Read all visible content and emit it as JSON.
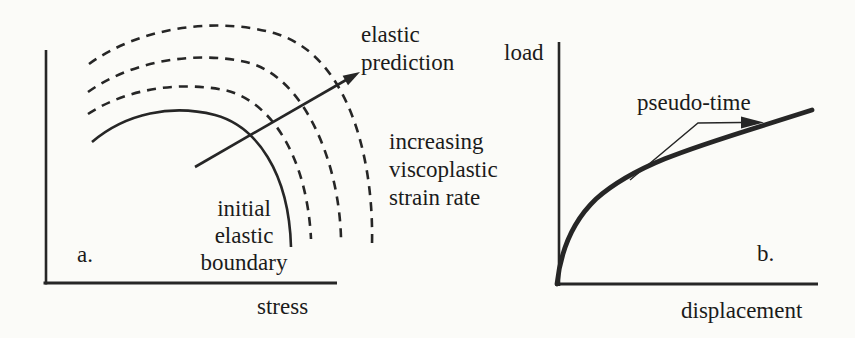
{
  "colors": {
    "background": "#fbfbf8",
    "ink": "#262626",
    "text": "#1b1b1b"
  },
  "panel_a": {
    "panel_label": "a.",
    "x_axis_label": "stress",
    "arrow_annotation": {
      "line1": "elastic",
      "line2": "prediction"
    },
    "rate_annotation": {
      "line1": "increasing",
      "line2": "viscoplastic",
      "line3": "strain rate"
    },
    "boundary_annotation": {
      "line1": "initial",
      "line2": "elastic",
      "line3": "boundary"
    },
    "curves": {
      "solid": "initial elastic boundary (solid yield surface)",
      "dashed": "three dashed surfaces for increasing viscoplastic strain rate",
      "arrow": "elastic prediction stress path arrow"
    }
  },
  "panel_b": {
    "panel_label": "b.",
    "y_axis_label": "load",
    "x_axis_label": "displacement",
    "curve_annotation": "pseudo-time",
    "curves": {
      "main": "load-displacement response curve with pseudo-time direction arrow"
    }
  }
}
